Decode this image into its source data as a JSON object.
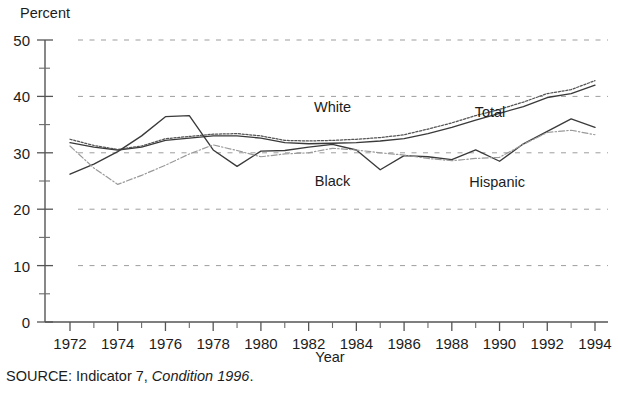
{
  "figure": {
    "y_axis_title": "Percent",
    "x_axis_title": "Year",
    "source_prefix": "SOURCE:  Indicator 7, ",
    "source_italic": "Condition 1996",
    "source_suffix": "."
  },
  "chart_data": {
    "type": "line",
    "title": "",
    "xlabel": "Year",
    "ylabel": "Percent",
    "xlim": [
      1972,
      1994
    ],
    "ylim": [
      0,
      50
    ],
    "grid": true,
    "legend_position": "inline-labels",
    "y_ticks_major": [
      0,
      10,
      20,
      30,
      40,
      50
    ],
    "y_ticks_minor": [
      5,
      15,
      25,
      35,
      45
    ],
    "x_tick_labels": [
      "1972",
      "1974",
      "1976",
      "1978",
      "1980",
      "1982",
      "1984",
      "1986",
      "1988",
      "1990",
      "1992",
      "1994"
    ],
    "x_tick_values": [
      1972,
      1974,
      1976,
      1978,
      1980,
      1982,
      1984,
      1986,
      1988,
      1990,
      1992,
      1994
    ],
    "x_minor_tick_values": [
      1973,
      1975,
      1977,
      1979,
      1981,
      1983,
      1985,
      1987,
      1989,
      1991,
      1993
    ],
    "x": [
      1972,
      1973,
      1974,
      1975,
      1976,
      1977,
      1978,
      1979,
      1980,
      1981,
      1982,
      1983,
      1984,
      1985,
      1986,
      1987,
      1988,
      1989,
      1990,
      1991,
      1992,
      1993,
      1994
    ],
    "series": [
      {
        "name": "Total",
        "label": "Total",
        "style": "solid",
        "color": "#3a3a3a",
        "label_x": 1989.6,
        "label_y": 36.4,
        "values": [
          31.8,
          31.0,
          30.5,
          31.0,
          32.2,
          32.6,
          33.0,
          33.0,
          32.6,
          31.8,
          31.6,
          31.7,
          31.8,
          32.1,
          32.5,
          33.4,
          34.5,
          35.8,
          37.0,
          38.2,
          39.8,
          40.5,
          42.0
        ]
      },
      {
        "name": "White",
        "label": "White",
        "style": "dotted",
        "color": "#555555",
        "label_x": 1983.0,
        "label_y": 37.2,
        "values": [
          32.4,
          31.3,
          30.6,
          31.2,
          32.5,
          32.9,
          33.3,
          33.4,
          33.0,
          32.2,
          32.1,
          32.2,
          32.4,
          32.7,
          33.2,
          34.2,
          35.3,
          36.6,
          37.7,
          39.0,
          40.5,
          41.2,
          42.8
        ]
      },
      {
        "name": "Black",
        "label": "Black",
        "style": "solid",
        "color": "#4d4d4d",
        "label_x": 1983.0,
        "label_y": 24.2,
        "values": [
          26.2,
          28.0,
          30.2,
          33.0,
          36.4,
          36.6,
          30.5,
          27.6,
          30.3,
          30.4,
          31.0,
          31.5,
          30.5,
          27.0,
          29.5,
          29.3,
          28.8,
          30.5,
          28.5,
          31.6,
          33.8,
          36.0,
          34.5
        ]
      },
      {
        "name": "Hispanic",
        "label": "Hispanic",
        "style": "dashdot",
        "color": "#9a9a9a",
        "label_x": 1989.9,
        "label_y": 24.0,
        "values": [
          31.2,
          27.3,
          24.4,
          26.0,
          27.8,
          29.8,
          31.4,
          30.4,
          29.3,
          29.8,
          30.0,
          30.8,
          30.5,
          30.0,
          29.6,
          29.0,
          28.6,
          29.0,
          29.2,
          31.5,
          33.6,
          34.0,
          33.2
        ]
      }
    ]
  }
}
